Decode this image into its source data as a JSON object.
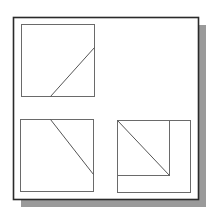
{
  "diagram": {
    "type": "orthographic-projection",
    "canvas": {
      "width": 214,
      "height": 218,
      "background": "#ffffff"
    },
    "colors": {
      "frame_stroke": "#2a2a2a",
      "shadow": "#9a9a9a",
      "view_stroke": "#6a6a6a",
      "edge_stroke": "#555555"
    },
    "frame": {
      "x": 13,
      "y": 17,
      "width": 185,
      "height": 182,
      "shadow_offset": 8
    },
    "views": [
      {
        "name": "top-view",
        "box": {
          "x": 21,
          "y": 24,
          "width": 73,
          "height": 72
        },
        "lines": [
          {
            "x1": 50,
            "y1": 96,
            "x2": 94,
            "y2": 47
          }
        ]
      },
      {
        "name": "front-view",
        "box": {
          "x": 20,
          "y": 119,
          "width": 73,
          "height": 72
        },
        "lines": [
          {
            "x1": 50,
            "y1": 119,
            "x2": 93,
            "y2": 174
          }
        ]
      },
      {
        "name": "side-view",
        "box": {
          "x": 117,
          "y": 120,
          "width": 73,
          "height": 72
        },
        "inner_box": {
          "x": 117,
          "y": 120,
          "width": 52,
          "height": 55
        },
        "lines": [
          {
            "x1": 117,
            "y1": 120,
            "x2": 169,
            "y2": 175
          }
        ]
      }
    ]
  }
}
